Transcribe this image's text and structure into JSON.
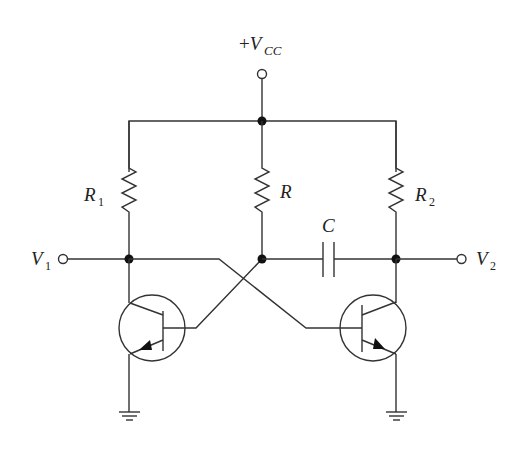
{
  "diagram": {
    "type": "circuit-schematic",
    "labels": {
      "supply": {
        "prefix": "+",
        "main": "V",
        "sub": "CC"
      },
      "r1": {
        "main": "R",
        "sub": "1"
      },
      "r": {
        "main": "R",
        "sub": ""
      },
      "r2": {
        "main": "R",
        "sub": "2"
      },
      "c": {
        "main": "C",
        "sub": ""
      },
      "v1": {
        "main": "V",
        "sub": "1"
      },
      "v2": {
        "main": "V",
        "sub": "2"
      }
    },
    "components": [
      {
        "id": "VCC",
        "kind": "supply-terminal"
      },
      {
        "id": "R1",
        "kind": "resistor",
        "between": [
          "VCC-rail",
          "V1-node"
        ]
      },
      {
        "id": "R",
        "kind": "resistor",
        "between": [
          "VCC-rail",
          "mid-node"
        ]
      },
      {
        "id": "R2",
        "kind": "resistor",
        "between": [
          "VCC-rail",
          "V2-node"
        ]
      },
      {
        "id": "C",
        "kind": "capacitor",
        "between": [
          "mid-node",
          "V2-node"
        ]
      },
      {
        "id": "Q1",
        "kind": "npn-transistor",
        "collector": "V1-node",
        "base": "mid-node",
        "emitter": "ground"
      },
      {
        "id": "Q2",
        "kind": "npn-transistor",
        "collector": "V2-node",
        "base": "V1-node",
        "emitter": "ground"
      },
      {
        "id": "V1",
        "kind": "output-terminal"
      },
      {
        "id": "V2",
        "kind": "output-terminal"
      }
    ],
    "colors": {
      "line": "#333333",
      "node": "#111111",
      "background": "#ffffff"
    }
  }
}
